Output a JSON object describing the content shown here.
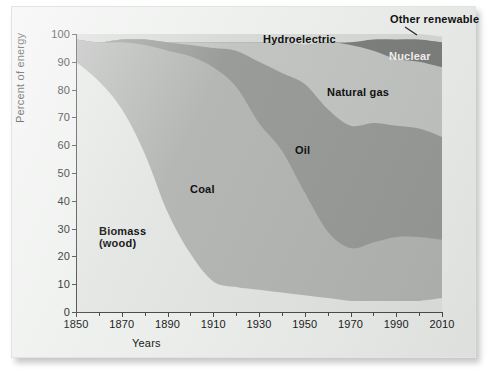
{
  "figure": {
    "xtitle": "Years",
    "ytitle": "Percent of energy"
  },
  "chart_data": {
    "type": "area",
    "stacked": true,
    "title": "",
    "xlabel": "Years",
    "ylabel": "Percent of energy",
    "xlim": [
      1850,
      2010
    ],
    "ylim": [
      0,
      100
    ],
    "grid": false,
    "legend_position": "in-plot annotations",
    "x_ticks": [
      1850,
      1870,
      1890,
      1910,
      1930,
      1950,
      1970,
      1990,
      2010
    ],
    "x_minor_ticks": [
      1860,
      1880,
      1900,
      1920,
      1940,
      1960,
      1980,
      2000
    ],
    "y_ticks": [
      0,
      10,
      20,
      30,
      40,
      50,
      60,
      70,
      80,
      90,
      100
    ],
    "x": [
      1850,
      1860,
      1870,
      1880,
      1890,
      1900,
      1910,
      1920,
      1930,
      1940,
      1950,
      1960,
      1970,
      1980,
      1990,
      2000,
      2010
    ],
    "series": [
      {
        "name": "Biomass (wood)",
        "label": "Biomass\n(wood)",
        "color": "#e4e6e4",
        "values": [
          90,
          83,
          73,
          57,
          36,
          21,
          11,
          9,
          8,
          7,
          6,
          5,
          4,
          4,
          4,
          4,
          5
        ]
      },
      {
        "name": "Coal",
        "label": "Coal",
        "color": "#b5b7b5",
        "values": [
          8,
          14,
          24,
          39,
          58,
          71,
          77,
          72,
          60,
          51,
          37,
          24,
          19,
          21,
          23,
          23,
          21
        ]
      },
      {
        "name": "Oil",
        "label": "Oil",
        "color": "#9a9c9a",
        "values": [
          0,
          0,
          1,
          2,
          3,
          4,
          7,
          13,
          22,
          28,
          39,
          44,
          44,
          43,
          40,
          39,
          37
        ]
      },
      {
        "name": "Natural gas",
        "label": "Natural gas",
        "color": "#c3c5c3",
        "values": [
          0,
          0,
          0,
          0,
          0,
          1,
          2,
          3,
          7,
          11,
          14,
          24,
          29,
          26,
          24,
          24,
          25
        ]
      },
      {
        "name": "Nuclear",
        "label": "Nuclear",
        "color": "#7e807e",
        "values": [
          0,
          0,
          0,
          0,
          0,
          0,
          0,
          0,
          0,
          0,
          0,
          0,
          1,
          4,
          7,
          8,
          9
        ]
      },
      {
        "name": "Hydroelectric",
        "label": "Hydroelectric",
        "color": "#d8dad8",
        "values": [
          2,
          3,
          2,
          2,
          3,
          3,
          3,
          3,
          3,
          3,
          4,
          3,
          3,
          2,
          2,
          2,
          2
        ]
      },
      {
        "name": "Other renewable",
        "label": "Other renewable",
        "color": "#eceeec",
        "values": [
          0,
          0,
          0,
          0,
          0,
          0,
          0,
          0,
          0,
          0,
          0,
          0,
          0,
          0,
          0,
          0,
          1
        ]
      }
    ],
    "annotations": [
      {
        "text": "Other renewable",
        "x": 2000,
        "y": 103,
        "style": "dark"
      },
      {
        "text": "Hydroelectric",
        "x": 1955,
        "y": 99,
        "style": "dark"
      },
      {
        "text": "Nuclear",
        "x": 1993,
        "y": 93,
        "style": "light"
      },
      {
        "text": "Natural gas",
        "x": 1972,
        "y": 84,
        "style": "dark"
      },
      {
        "text": "Oil",
        "x": 1945,
        "y": 58,
        "style": "dark"
      },
      {
        "text": "Coal",
        "x": 1905,
        "y": 46,
        "style": "dark"
      },
      {
        "text": "Biomass (wood)",
        "x": 1872,
        "y": 30,
        "style": "dark"
      }
    ]
  },
  "labels": {
    "other_renewable": "Other renewable",
    "hydroelectric": "Hydroelectric",
    "nuclear": "Nuclear",
    "natural_gas": "Natural gas",
    "oil": "Oil",
    "coal": "Coal",
    "biomass_line1": "Biomass",
    "biomass_line2": "(wood)"
  },
  "ticks": {
    "y": [
      "100",
      "90",
      "80",
      "70",
      "60",
      "50",
      "40",
      "30",
      "20",
      "10",
      "0"
    ],
    "x": [
      "1850",
      "1870",
      "1890",
      "1910",
      "1930",
      "1950",
      "1970",
      "1990",
      "2010"
    ]
  },
  "colors": {
    "page": "#eef0ee",
    "biomass": "#e4e6e4",
    "coal": "#b5b7b5",
    "oil": "#9a9c9a",
    "natural_gas": "#c3c5c3",
    "nuclear": "#7e807e",
    "hydroelectric": "#d8dad8",
    "other_renewable": "#eceeec",
    "axis": "#4c4c4c",
    "text": "#1b1b1b"
  }
}
